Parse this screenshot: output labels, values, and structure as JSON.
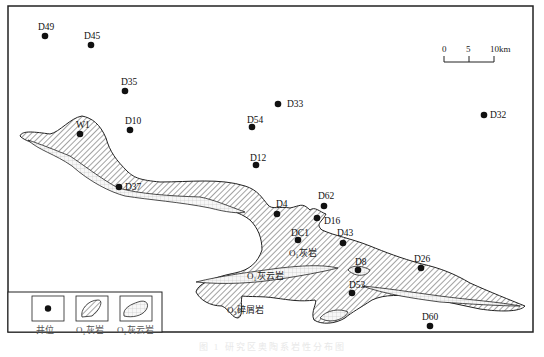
{
  "map": {
    "scale_bar": {
      "ticks": [
        "0",
        "5",
        "10km"
      ]
    },
    "wells": [
      {
        "id": "D49",
        "x": 45,
        "y": 36,
        "lx": 38,
        "ly": 30
      },
      {
        "id": "D45",
        "x": 91,
        "y": 45,
        "lx": 84,
        "ly": 39
      },
      {
        "id": "D35",
        "x": 125,
        "y": 91,
        "lx": 121,
        "ly": 85
      },
      {
        "id": "D10",
        "x": 130,
        "y": 130,
        "lx": 125,
        "ly": 124
      },
      {
        "id": "D33",
        "x": 278,
        "y": 104,
        "lx": 287,
        "ly": 107
      },
      {
        "id": "D32",
        "x": 484,
        "y": 115,
        "lx": 490,
        "ly": 118
      },
      {
        "id": "D54",
        "x": 252,
        "y": 127,
        "lx": 247,
        "ly": 123
      },
      {
        "id": "D12",
        "x": 256,
        "y": 165,
        "lx": 250,
        "ly": 161
      },
      {
        "id": "W1",
        "x": 80,
        "y": 134,
        "lx": 76,
        "ly": 128
      },
      {
        "id": "D37",
        "x": 119,
        "y": 187,
        "lx": 125,
        "ly": 190
      },
      {
        "id": "D4",
        "x": 277,
        "y": 214,
        "lx": 276,
        "ly": 207
      },
      {
        "id": "D62",
        "x": 324,
        "y": 206,
        "lx": 318,
        "ly": 199
      },
      {
        "id": "D16",
        "x": 317,
        "y": 218,
        "lx": 324,
        "ly": 224
      },
      {
        "id": "DC1",
        "x": 298,
        "y": 240,
        "lx": 291,
        "ly": 236
      },
      {
        "id": "D43",
        "x": 343,
        "y": 243,
        "lx": 337,
        "ly": 236
      },
      {
        "id": "D8",
        "x": 358,
        "y": 270,
        "lx": 355,
        "ly": 265
      },
      {
        "id": "D53",
        "x": 352,
        "y": 293,
        "lx": 349,
        "ly": 288
      },
      {
        "id": "D26",
        "x": 421,
        "y": 268,
        "lx": 414,
        "ly": 262
      },
      {
        "id": "D60",
        "x": 430,
        "y": 326,
        "lx": 422,
        "ly": 320
      }
    ],
    "formation_labels": [
      {
        "text": "O₁灰岩",
        "x": 289,
        "y": 256
      },
      {
        "text": "O₁灰云岩",
        "x": 247,
        "y": 279
      },
      {
        "text": "O₃碎屑岩",
        "x": 227,
        "y": 313
      }
    ]
  },
  "legend": {
    "items": [
      {
        "label": "井位",
        "symbol": "well-dot"
      },
      {
        "label": "O₁灰岩",
        "symbol": "limestone-hatch"
      },
      {
        "label": "O₁灰云岩",
        "symbol": "dolomite-crosshatch"
      }
    ]
  },
  "caption": "图 1 研究区奥陶系岩性分布图"
}
